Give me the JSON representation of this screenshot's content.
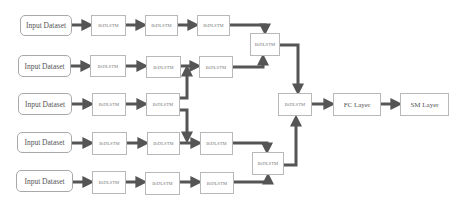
{
  "diagram": {
    "colors": {
      "arrow": "#555555",
      "box_border": "#b8b8b8",
      "background": "#ffffff"
    },
    "rows": [
      {
        "input": "Input Dataset",
        "cells": [
          "BiDLSTM",
          "BiDLSTM",
          "BiDLSTM"
        ]
      },
      {
        "input": "Input Dataset",
        "cells": [
          "BiDLSTM",
          "BiDLSTM",
          "BiDLSTM"
        ]
      },
      {
        "input": "Input Dataset",
        "cells": [
          "BiDLSTM",
          "BiDLSTM"
        ]
      },
      {
        "input": "Input Dataset",
        "cells": [
          "BiDLSTM",
          "BiDLSTM",
          "BiDLSTM"
        ]
      },
      {
        "input": "Input Dataset",
        "cells": [
          "BiDLSTM",
          "BiDLSTM",
          "BiDLSTM"
        ]
      }
    ],
    "merge_top": "BiDLSTM",
    "merge_bottom": "BiDLSTM",
    "merge_center": "BiDLSTM",
    "fc_layer": "FC Layer",
    "sm_layer": "SM Layer"
  }
}
